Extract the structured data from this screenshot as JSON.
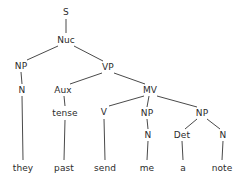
{
  "figure": {
    "type": "syntax-tree",
    "sentence": "they past send me a note",
    "background_color": "#ffffff",
    "line_color": "#4a4a4a",
    "text_color": "#2b2b2b"
  },
  "nodes": [
    {
      "id": "s",
      "label": "S",
      "x": 66,
      "y": 12
    },
    {
      "id": "nuc",
      "label": "Nuc",
      "x": 66,
      "y": 40
    },
    {
      "id": "np1",
      "label": "NP",
      "x": 21,
      "y": 66
    },
    {
      "id": "vp",
      "label": "VP",
      "x": 108,
      "y": 67
    },
    {
      "id": "n1",
      "label": "N",
      "x": 22,
      "y": 90
    },
    {
      "id": "aux",
      "label": "Aux",
      "x": 63,
      "y": 90
    },
    {
      "id": "mv",
      "label": "MV",
      "x": 150,
      "y": 90
    },
    {
      "id": "tense",
      "label": "tense",
      "x": 65,
      "y": 113
    },
    {
      "id": "v",
      "label": "V",
      "x": 104,
      "y": 112
    },
    {
      "id": "np2",
      "label": "NP",
      "x": 147,
      "y": 113
    },
    {
      "id": "np3",
      "label": "NP",
      "x": 202,
      "y": 113
    },
    {
      "id": "n2",
      "label": "N",
      "x": 148,
      "y": 135
    },
    {
      "id": "det",
      "label": "Det",
      "x": 182,
      "y": 135
    },
    {
      "id": "n3",
      "label": "N",
      "x": 223,
      "y": 135
    }
  ],
  "leaves": [
    {
      "id": "w-they",
      "label": "they",
      "x": 23,
      "y": 168
    },
    {
      "id": "w-past",
      "label": "past",
      "x": 64,
      "y": 168
    },
    {
      "id": "w-send",
      "label": "send",
      "x": 105,
      "y": 168
    },
    {
      "id": "w-me",
      "label": "me",
      "x": 147,
      "y": 168
    },
    {
      "id": "w-a",
      "label": "a",
      "x": 183,
      "y": 168
    },
    {
      "id": "w-note",
      "label": "note",
      "x": 222,
      "y": 168
    }
  ],
  "edges": [
    {
      "from": "s",
      "to": "nuc",
      "x1": 66,
      "y1": 19,
      "x2": 66,
      "y2": 33
    },
    {
      "from": "nuc",
      "to": "np1",
      "x1": 58,
      "y1": 46,
      "x2": 27,
      "y2": 60
    },
    {
      "from": "nuc",
      "to": "vp",
      "x1": 74,
      "y1": 46,
      "x2": 103,
      "y2": 61
    },
    {
      "from": "np1",
      "to": "n1",
      "x1": 21,
      "y1": 72,
      "x2": 22,
      "y2": 84
    },
    {
      "from": "n1",
      "to": "w-they",
      "x1": 22,
      "y1": 96,
      "x2": 23,
      "y2": 160
    },
    {
      "from": "vp",
      "to": "aux",
      "x1": 102,
      "y1": 73,
      "x2": 70,
      "y2": 84
    },
    {
      "from": "vp",
      "to": "mv",
      "x1": 114,
      "y1": 73,
      "x2": 145,
      "y2": 84
    },
    {
      "from": "aux",
      "to": "tense",
      "x1": 64,
      "y1": 96,
      "x2": 65,
      "y2": 106
    },
    {
      "from": "tense",
      "to": "w-past",
      "x1": 65,
      "y1": 120,
      "x2": 64,
      "y2": 160
    },
    {
      "from": "mv",
      "to": "v",
      "x1": 144,
      "y1": 96,
      "x2": 109,
      "y2": 106
    },
    {
      "from": "mv",
      "to": "np2",
      "x1": 149,
      "y1": 96,
      "x2": 147,
      "y2": 107
    },
    {
      "from": "mv",
      "to": "np3",
      "x1": 157,
      "y1": 96,
      "x2": 197,
      "y2": 107
    },
    {
      "from": "v",
      "to": "w-send",
      "x1": 104,
      "y1": 119,
      "x2": 105,
      "y2": 160
    },
    {
      "from": "np2",
      "to": "n2",
      "x1": 147,
      "y1": 119,
      "x2": 148,
      "y2": 129
    },
    {
      "from": "n2",
      "to": "w-me",
      "x1": 148,
      "y1": 141,
      "x2": 147,
      "y2": 160
    },
    {
      "from": "np3",
      "to": "det",
      "x1": 197,
      "y1": 119,
      "x2": 185,
      "y2": 129
    },
    {
      "from": "np3",
      "to": "n3",
      "x1": 207,
      "y1": 119,
      "x2": 220,
      "y2": 129
    },
    {
      "from": "det",
      "to": "w-a",
      "x1": 182,
      "y1": 141,
      "x2": 183,
      "y2": 160
    },
    {
      "from": "n3",
      "to": "w-note",
      "x1": 223,
      "y1": 141,
      "x2": 222,
      "y2": 160
    }
  ]
}
